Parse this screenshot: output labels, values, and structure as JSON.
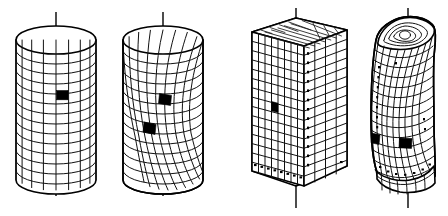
{
  "figure": {
    "background_color": "#ffffff",
    "line_color": "#111111",
    "outline_color": "#000000",
    "highlight_color": "#000000",
    "width": 448,
    "height": 216
  },
  "objects": [
    {
      "id": "cylinder-undeformed",
      "label": "Undeformed cylinder mesh",
      "shape": "cylinder",
      "state": "undeformed",
      "axis_visible": true,
      "mesh_rows": 14,
      "mesh_columns": 8,
      "highlighted_cells": 1,
      "center_x": 56,
      "center_y": 110,
      "radius_x": 40,
      "radius_y": 14,
      "top_y": 40,
      "bottom_y": 180
    },
    {
      "id": "cylinder-twisted",
      "label": "Twisted cylinder mesh",
      "shape": "cylinder",
      "state": "twisted",
      "axis_visible": true,
      "mesh_rows": 14,
      "mesh_columns": 8,
      "highlighted_cells": 2,
      "twist_angle_deg": 38,
      "center_x": 163,
      "center_y": 110,
      "radius_x": 40,
      "radius_y": 14,
      "top_y": 40,
      "bottom_y": 180
    },
    {
      "id": "block-undeformed",
      "label": "Undeformed rectangular block mesh",
      "shape": "rectangular-prism",
      "state": "undeformed",
      "axis_visible": true,
      "mesh_rows": 15,
      "mesh_columns": 8,
      "highlighted_cells": 1,
      "dotted_marker_column": true,
      "dotted_marker_row": true
    },
    {
      "id": "block-twisted",
      "label": "Twisted rectangular block mesh",
      "shape": "rectangular-prism",
      "state": "twisted",
      "axis_visible": true,
      "mesh_rows": 15,
      "mesh_columns": 8,
      "highlighted_cells": 2,
      "top_face_contours": 5,
      "dotted_marker_column": true,
      "dotted_marker_row": true
    }
  ],
  "annotations": {
    "axis_count": 4,
    "highlight_total": 6
  }
}
